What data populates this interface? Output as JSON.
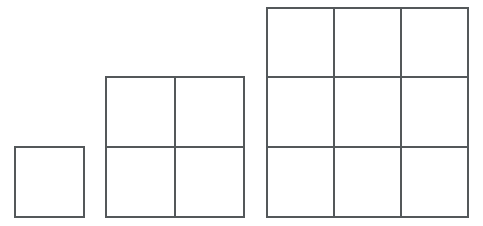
{
  "figure": {
    "title": "Growing square grids pattern",
    "background_color": "#ffffff",
    "line_color": "#54585a",
    "line_width": 2,
    "canvas": {
      "width": 483,
      "height": 226
    },
    "unit_cell": {
      "width": 69,
      "height": 70
    },
    "baseline_y": 217,
    "shapes": [
      {
        "name": "term-1-grid",
        "label": "1",
        "rows": 1,
        "cols": 2,
        "columns": 1,
        "squares_count": 1,
        "x": 15,
        "y": 147,
        "width": 69,
        "height": 70,
        "cell_width": 69,
        "cell_height": 70,
        "vertical_dividers": [],
        "horizontal_dividers": []
      },
      {
        "name": "term-2-grid",
        "label": "2",
        "rows": 2,
        "cols": 2,
        "columns": 2,
        "squares_count": 4,
        "x": 106,
        "y": 77,
        "width": 138,
        "height": 140,
        "cell_width": 69,
        "cell_height": 70,
        "vertical_dividers": [
          175
        ],
        "horizontal_dividers": [
          147
        ]
      },
      {
        "name": "term-3-grid",
        "label": "3",
        "rows": 3,
        "cols": 3,
        "columns": 3,
        "squares_count": 9,
        "x": 267,
        "y": 8,
        "width": 201,
        "height": 209,
        "cell_width": 67,
        "cell_height": 69.7,
        "vertical_dividers": [
          334,
          401
        ],
        "horizontal_dividers": [
          77,
          147
        ]
      }
    ],
    "gaps": {
      "between_1_and_2": 22,
      "between_2_and_3": 23
    }
  },
  "chart_data": {
    "type": "diagram",
    "title": "Growing square grids pattern",
    "categories": [
      "1",
      "2",
      "3"
    ],
    "values": [
      1,
      4,
      9
    ],
    "xlabel": "",
    "ylabel": "number of unit squares",
    "series": [
      {
        "name": "side length (units)",
        "values": [
          1,
          2,
          3
        ]
      },
      {
        "name": "unit squares",
        "values": [
          1,
          4,
          9
        ]
      }
    ],
    "legend": [],
    "grid": true
  }
}
